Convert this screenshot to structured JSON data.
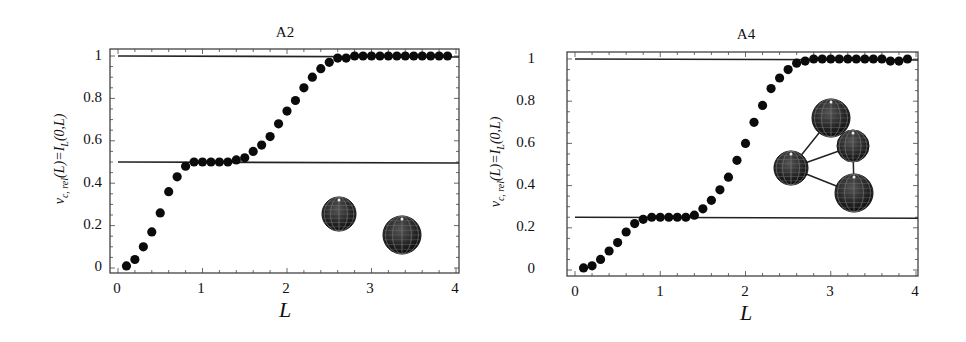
{
  "chart_data": [
    {
      "type": "scatter",
      "title": "A2",
      "xlabel": "L",
      "ylabel": "v_{c,rel}(L)=I_L(0,L)",
      "xlim": [
        0,
        4
      ],
      "ylim": [
        0,
        1
      ],
      "xticks": [
        "0",
        "1",
        "2",
        "3",
        "4"
      ],
      "yticks": [
        "0",
        "0.2",
        "0.4",
        "0.6",
        "0.8",
        "1"
      ],
      "reference_lines": [
        1.0,
        0.5
      ],
      "inset": "two spheres",
      "x": [
        0.1,
        0.2,
        0.3,
        0.4,
        0.5,
        0.6,
        0.7,
        0.8,
        0.9,
        1.0,
        1.1,
        1.2,
        1.3,
        1.4,
        1.5,
        1.6,
        1.7,
        1.8,
        1.9,
        2.0,
        2.1,
        2.2,
        2.3,
        2.4,
        2.5,
        2.6,
        2.7,
        2.8,
        2.9,
        3.0,
        3.1,
        3.2,
        3.3,
        3.4,
        3.5,
        3.6,
        3.7,
        3.8,
        3.9
      ],
      "y": [
        0.01,
        0.04,
        0.1,
        0.17,
        0.26,
        0.36,
        0.43,
        0.48,
        0.5,
        0.5,
        0.5,
        0.5,
        0.5,
        0.51,
        0.52,
        0.55,
        0.58,
        0.62,
        0.68,
        0.74,
        0.79,
        0.85,
        0.9,
        0.94,
        0.97,
        0.99,
        0.99,
        1.0,
        1.0,
        1.0,
        1.0,
        1.0,
        1.0,
        1.0,
        1.0,
        1.0,
        1.0,
        1.0,
        1.0
      ]
    },
    {
      "type": "scatter",
      "title": "A4",
      "xlabel": "L",
      "ylabel": "v_{c,rel}(L)=I_L(0,L)",
      "xlim": [
        0,
        4
      ],
      "ylim": [
        0,
        1
      ],
      "xticks": [
        "0",
        "1",
        "2",
        "3",
        "4"
      ],
      "yticks": [
        "0",
        "0.2",
        "0.4",
        "0.6",
        "0.8",
        "1"
      ],
      "reference_lines": [
        1.0,
        0.25
      ],
      "inset": "four connected spheres",
      "x": [
        0.1,
        0.2,
        0.3,
        0.4,
        0.5,
        0.6,
        0.7,
        0.8,
        0.9,
        1.0,
        1.1,
        1.2,
        1.3,
        1.4,
        1.5,
        1.6,
        1.7,
        1.8,
        1.9,
        2.0,
        2.1,
        2.2,
        2.3,
        2.4,
        2.5,
        2.6,
        2.7,
        2.8,
        2.9,
        3.0,
        3.1,
        3.2,
        3.3,
        3.4,
        3.5,
        3.6,
        3.7,
        3.8,
        3.9
      ],
      "y": [
        0.01,
        0.02,
        0.05,
        0.09,
        0.13,
        0.18,
        0.22,
        0.24,
        0.25,
        0.25,
        0.25,
        0.25,
        0.25,
        0.26,
        0.29,
        0.33,
        0.38,
        0.44,
        0.52,
        0.6,
        0.7,
        0.78,
        0.86,
        0.91,
        0.95,
        0.98,
        0.99,
        1.0,
        1.0,
        1.0,
        1.0,
        1.0,
        1.0,
        1.0,
        1.0,
        1.0,
        0.99,
        0.99,
        1.0
      ]
    }
  ],
  "labels": {
    "left_title": "A2",
    "right_title": "A4",
    "xlabel": "L",
    "ylabel": "vc, rel(L)=IL(0,L)",
    "xticks": [
      "0",
      "1",
      "2",
      "3",
      "4"
    ],
    "yticks": [
      "0",
      "0.2",
      "0.4",
      "0.6",
      "0.8",
      "1"
    ]
  }
}
